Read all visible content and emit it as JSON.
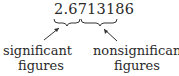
{
  "diagram": {
    "number": "2.6713186",
    "significant_part": "2.67",
    "nonsignificant_part": "13186",
    "labels": {
      "left_line1": "significant",
      "left_line2": "figures",
      "right_line1": "nonsignificant",
      "right_line2": "figures"
    }
  }
}
